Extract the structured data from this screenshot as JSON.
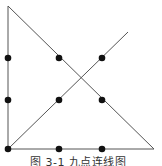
{
  "figure": {
    "caption": "图 3-1  九点连线图",
    "colors": {
      "line": "#555555",
      "dot": "#111111",
      "background": "#ffffff"
    },
    "dots": [
      {
        "x": 8,
        "y": 58
      },
      {
        "x": 59,
        "y": 58
      },
      {
        "x": 102,
        "y": 58
      },
      {
        "x": 8,
        "y": 100
      },
      {
        "x": 59,
        "y": 100
      },
      {
        "x": 102,
        "y": 100
      },
      {
        "x": 8,
        "y": 149
      },
      {
        "x": 59,
        "y": 149
      },
      {
        "x": 102,
        "y": 149
      }
    ],
    "path": [
      {
        "x": 8,
        "y": 6
      },
      {
        "x": 8,
        "y": 149
      },
      {
        "x": 128,
        "y": 32
      }
    ],
    "lines": [
      {
        "from": {
          "x": 8,
          "y": 6
        },
        "to": {
          "x": 8,
          "y": 149
        }
      },
      {
        "from": {
          "x": 8,
          "y": 149
        },
        "to": {
          "x": 128,
          "y": 32
        }
      },
      {
        "from": {
          "x": 8,
          "y": 6
        },
        "to": {
          "x": 154,
          "y": 149
        }
      },
      {
        "from": {
          "x": 8,
          "y": 149
        },
        "to": {
          "x": 154,
          "y": 149
        }
      }
    ]
  }
}
